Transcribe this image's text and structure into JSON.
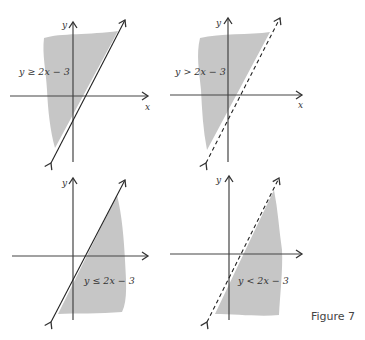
{
  "figure": {
    "caption": "Figure 7",
    "shade_color": "#c6c6c6",
    "line_color": "#222222",
    "axis_color": "#444444",
    "panels": [
      {
        "id": "top-left",
        "inequality": "y ≥ 2x − 3",
        "boundary": "solid",
        "shaded": "above-left",
        "x_label": "x",
        "y_label": "y"
      },
      {
        "id": "top-right",
        "inequality": "y > 2x − 3",
        "boundary": "dashed",
        "shaded": "above-left",
        "x_label": "x",
        "y_label": "y"
      },
      {
        "id": "bottom-left",
        "inequality": "y ≤ 2x − 3",
        "boundary": "solid",
        "shaded": "below-right",
        "x_label": "",
        "y_label": "y"
      },
      {
        "id": "bottom-right",
        "inequality": "y < 2x − 3",
        "boundary": "dashed",
        "shaded": "below-right",
        "x_label": "",
        "y_label": "y"
      }
    ]
  }
}
